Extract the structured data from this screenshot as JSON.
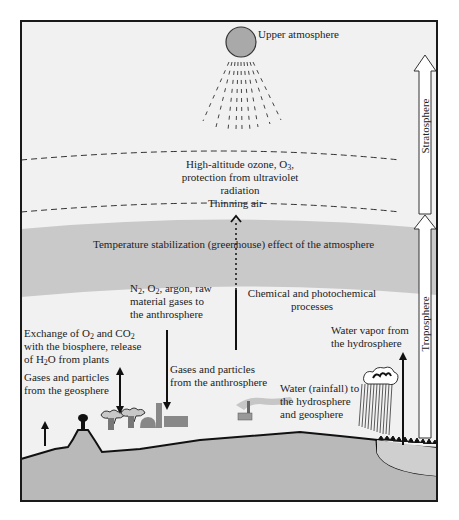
{
  "colors": {
    "background": "#f1f1f1",
    "greenhouse_band": "#c9c9c9",
    "ground": "#b9b9b9",
    "sun": "#a9a9a9",
    "frame": "#1a1a1a",
    "text": "#222222"
  },
  "labels": {
    "upper_atmosphere": "Upper atmosphere",
    "ozone_line1": "High-altitude ozone, O",
    "ozone_sub": "3",
    "ozone_line1_end": ",",
    "ozone_line2": "protection from ultraviolet",
    "ozone_line3": "radiation",
    "thinning_air": "Thinning air",
    "greenhouse": "Temperature stabilization (greenhouse) effect of the atmosphere",
    "n2_a": "N",
    "n2_sub": "2",
    "n2_b": ", O",
    "n2_sub2": "2",
    "n2_c": ", argon, raw",
    "n2_line2": "material gases to",
    "n2_line3": "the anthrosphere",
    "chemical_line1": "Chemical and photochemical",
    "chemical_line2": "processes",
    "exchange_a": "Exchange of O",
    "exchange_sub1": "2",
    "exchange_b": " and CO",
    "exchange_sub2": "2",
    "exchange_line2": "with the biosphere, release",
    "exchange_line3_a": "of H",
    "exchange_line3_sub": "2",
    "exchange_line3_b": "O from plants",
    "geo_line1": "Gases and particles",
    "geo_line2": "from the geosphere",
    "anthro_line1": "Gases and particles",
    "anthro_line2": "from the anthrosphere",
    "vapor_line1": "Water vapor from",
    "vapor_line2": "the hydrosphere",
    "rain_line1": "Water (rainfall) to",
    "rain_line2": "the hydrosphere",
    "rain_line3": "and geosphere",
    "stratosphere": "Stratosphere",
    "troposphere": "Troposphere"
  }
}
